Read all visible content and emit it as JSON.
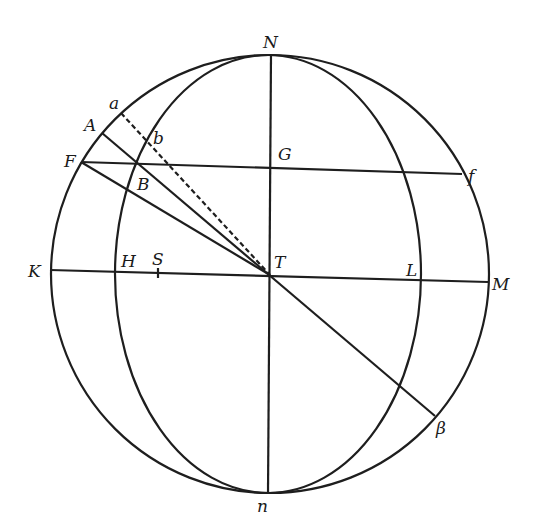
{
  "diagram": {
    "type": "celestial-sphere-geometry",
    "colors": {
      "ink": "#1e1e1e",
      "background": "#ffffff"
    },
    "outer_circle": {
      "cx": 270,
      "cy": 274,
      "rx": 219,
      "ry": 219
    },
    "inner_ellipse": {
      "cx": 268,
      "cy": 274,
      "rx": 153,
      "ry": 219
    },
    "points": {
      "N": {
        "label": "N",
        "x": 271,
        "y": 55
      },
      "n": {
        "label": "n",
        "x": 268,
        "y": 493
      },
      "T": {
        "label": "T",
        "x": 270,
        "y": 275
      },
      "G": {
        "label": "G",
        "x": 270,
        "y": 168
      },
      "K": {
        "label": "K",
        "x": 50,
        "y": 270
      },
      "M": {
        "label": "M",
        "x": 488,
        "y": 282
      },
      "H": {
        "label": "H",
        "x": 116,
        "y": 272
      },
      "L": {
        "label": "L",
        "x": 422,
        "y": 280
      },
      "S": {
        "label": "S",
        "x": 158,
        "y": 273
      },
      "F": {
        "label": "F",
        "x": 81,
        "y": 162
      },
      "f": {
        "label": "f",
        "x": 462,
        "y": 174
      },
      "A": {
        "label": "A",
        "x": 102,
        "y": 133
      },
      "B": {
        "label": "B",
        "x": 137,
        "y": 164
      },
      "a": {
        "label": "a",
        "x": 121,
        "y": 113
      },
      "b": {
        "label": "b",
        "x": 146,
        "y": 142
      },
      "beta": {
        "label": "β",
        "x": 435,
        "y": 416
      }
    },
    "labels": {
      "N": "N",
      "n": "n",
      "T": "T",
      "G": "G",
      "K": "K",
      "M": "M",
      "H": "H",
      "L": "L",
      "S": "S",
      "F": "F",
      "f": "f",
      "A": "A",
      "B": "B",
      "a": "a",
      "b": "b",
      "beta": "β"
    },
    "segments": [
      {
        "name": "axis-Nn",
        "from": "N",
        "to": "n",
        "style": "solid"
      },
      {
        "name": "line-KM",
        "from": "K",
        "to": "M",
        "style": "solid"
      },
      {
        "name": "line-Ff",
        "from": "F",
        "to": "f",
        "style": "solid"
      },
      {
        "name": "line-A-beta",
        "from": "A",
        "to": "beta",
        "style": "solid"
      },
      {
        "name": "line-FT",
        "from": "F",
        "to": "T",
        "style": "solid"
      },
      {
        "name": "line-aT",
        "from": "a",
        "to": "T",
        "style": "dashed"
      }
    ]
  }
}
